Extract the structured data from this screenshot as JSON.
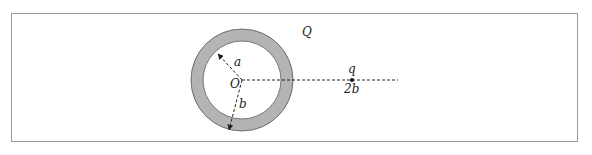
{
  "diagram": {
    "type": "physics-figure",
    "labels": {
      "shell_charge": "Q",
      "inner_radius": "a",
      "outer_radius": "b",
      "center": "O",
      "point_charge": "q",
      "point_distance": "2b"
    },
    "colors": {
      "shell_fill": "#b4b4b4",
      "border": "#9a9a9a",
      "lines": "#222222"
    }
  }
}
